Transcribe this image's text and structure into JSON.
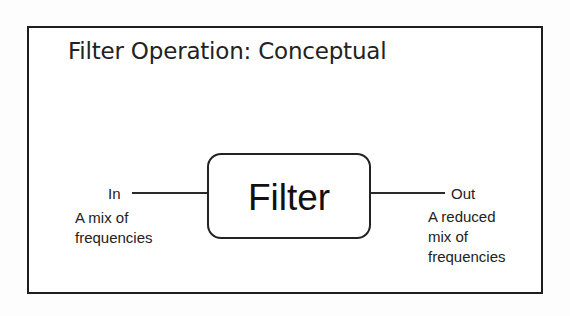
{
  "slide": {
    "title": "Filter Operation: Conceptual"
  },
  "diagram": {
    "block": {
      "label": "Filter"
    },
    "input": {
      "label": "In",
      "description_lines": [
        "A mix of",
        "frequencies"
      ]
    },
    "output": {
      "label": "Out",
      "description_lines": [
        "A reduced",
        "mix of",
        "frequencies"
      ]
    }
  },
  "colors": {
    "border": "#1e1e1e",
    "text": "#222222",
    "background": "#ffffff"
  }
}
